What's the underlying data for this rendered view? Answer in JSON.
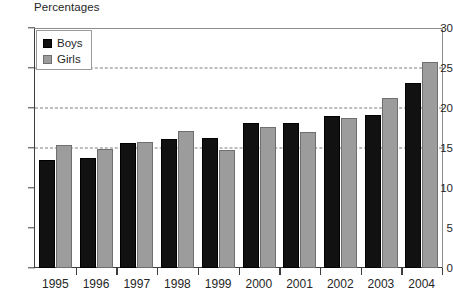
{
  "chart_data": {
    "type": "bar",
    "title": "Percentages",
    "xlabel": "",
    "ylabel": "",
    "ylim": [
      0,
      30
    ],
    "yticks": [
      0,
      5,
      10,
      15,
      20,
      25,
      30
    ],
    "grid": "dashed horizontal gridlines at 15, 20 and 25",
    "legend_position": "top-left inside plot area",
    "categories": [
      "1995",
      "1996",
      "1997",
      "1998",
      "1999",
      "2000",
      "2001",
      "2002",
      "2003",
      "2004"
    ],
    "series": [
      {
        "name": "Boys",
        "color": "#111111",
        "values": [
          13.5,
          13.8,
          15.6,
          16.1,
          16.3,
          18.1,
          18.1,
          19.0,
          19.1,
          23.1
        ]
      },
      {
        "name": "Girls",
        "color": "#9c9c9c",
        "values": [
          15.4,
          14.9,
          15.8,
          17.1,
          14.7,
          17.6,
          17.0,
          18.8,
          21.2,
          25.7
        ]
      }
    ]
  },
  "legend": {
    "items": [
      {
        "label": "Boys",
        "swatch": "boys"
      },
      {
        "label": "Girls",
        "swatch": "girls"
      }
    ]
  },
  "axis": {
    "y_tick_labels": [
      "30",
      "25",
      "20",
      "15",
      "10",
      "5",
      "0"
    ],
    "x_tick_labels": [
      "1995",
      "1996",
      "1997",
      "1998",
      "1999",
      "2000",
      "2001",
      "2002",
      "2003",
      "2004"
    ]
  }
}
